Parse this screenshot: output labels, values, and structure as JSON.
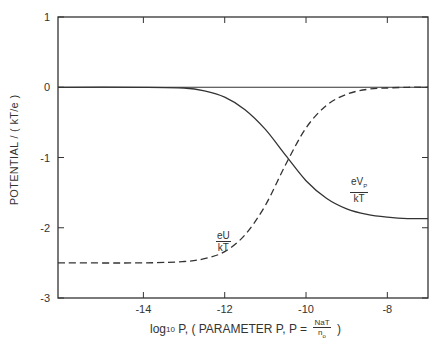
{
  "chart_data": {
    "type": "line",
    "title": "",
    "xlabel": "log10 P, ( PARAMETER P, P = NaT / n0 )",
    "ylabel": "POTENTIAL / ( kT/e )",
    "xlim": [
      -16.1,
      -7.0
    ],
    "ylim": [
      -3,
      1
    ],
    "xticks": [
      -14,
      -12,
      -10,
      -8
    ],
    "yticks": [
      1,
      0,
      -1,
      -2,
      -3
    ],
    "grid": false,
    "legend": "inline labels",
    "reference_lines": [
      {
        "y": 0,
        "style": "solid"
      }
    ],
    "series": [
      {
        "name": "eVp/kT",
        "style": "solid",
        "x": [
          -16.1,
          -14,
          -13.0,
          -12.5,
          -12.0,
          -11.5,
          -11.0,
          -10.5,
          -10.0,
          -9.5,
          -9.0,
          -8.5,
          -8.0,
          -7.5,
          -7.0
        ],
        "y": [
          0,
          0,
          -0.01,
          -0.05,
          -0.14,
          -0.32,
          -0.6,
          -0.97,
          -1.33,
          -1.58,
          -1.73,
          -1.81,
          -1.85,
          -1.87,
          -1.87
        ]
      },
      {
        "name": "eU/kT",
        "style": "dashed",
        "x": [
          -16.1,
          -14,
          -13.0,
          -12.5,
          -12.0,
          -11.5,
          -11.0,
          -10.5,
          -10.0,
          -9.5,
          -9.0,
          -8.5,
          -8.0,
          -7.5,
          -7.0
        ],
        "y": [
          -2.5,
          -2.5,
          -2.48,
          -2.44,
          -2.34,
          -2.1,
          -1.68,
          -1.1,
          -0.58,
          -0.26,
          -0.1,
          -0.03,
          -0.01,
          0,
          0
        ]
      }
    ]
  },
  "axes": {
    "yticks": [
      "1",
      "0",
      "-1",
      "-2",
      "-3"
    ],
    "xticks": [
      "-14",
      "-12",
      "-10",
      "-8"
    ],
    "ylabel": "POTENTIAL / ( kT/e )",
    "xlabel_prefix": "log",
    "xlabel_sub": "10",
    "xlabel_mid": " P, ( PARAMETER P, P = ",
    "xlabel_frac_num": "NaT",
    "xlabel_frac_den": "n",
    "xlabel_frac_den_sub": "o",
    "xlabel_suffix": " )"
  },
  "labels": {
    "vp_num": "eV",
    "vp_num_sub": "P",
    "vp_den": "kT",
    "u_num": "eU",
    "u_den": "kT"
  }
}
